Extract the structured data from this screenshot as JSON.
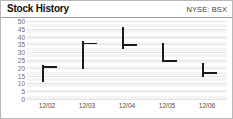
{
  "header": {
    "title": "Stock History",
    "ticker": "NYSE: BSX"
  },
  "chart_data": {
    "type": "bar",
    "subtype": "hlc-high-low-close",
    "title": "Stock History",
    "xlabel": "",
    "ylabel": "",
    "ylim": [
      0,
      50
    ],
    "ytick_step": 5,
    "yticks": [
      50,
      45,
      40,
      35,
      30,
      25,
      20,
      15,
      10,
      5,
      0
    ],
    "grid": true,
    "legend": false,
    "categories": [
      "12/02",
      "12/03",
      "12/04",
      "12/05",
      "12/06"
    ],
    "series": [
      {
        "name": "High",
        "values": [
          22,
          37,
          46,
          36,
          23
        ]
      },
      {
        "name": "Low",
        "values": [
          11,
          19,
          32,
          24,
          14
        ]
      },
      {
        "name": "Close",
        "values": [
          21,
          36,
          35,
          25,
          17
        ]
      }
    ],
    "bars": [
      {
        "date": "12/02",
        "high": 22,
        "low": 11,
        "close": 21
      },
      {
        "date": "12/03",
        "high": 37,
        "low": 19,
        "close": 36
      },
      {
        "date": "12/04",
        "high": 46,
        "low": 32,
        "close": 35
      },
      {
        "date": "12/05",
        "high": 36,
        "low": 24,
        "close": 25
      },
      {
        "date": "12/06",
        "high": 23,
        "low": 14,
        "close": 17
      }
    ],
    "colors": {
      "bar": "#1b1b1b",
      "plot_background": "#f4f4f4",
      "gridline": "#e4e4e4",
      "axis_text": "#6c6c6c"
    }
  }
}
